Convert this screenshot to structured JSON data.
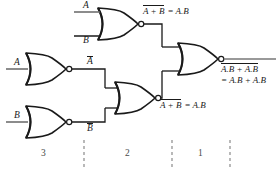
{
  "diagram": {
    "stroke_color": "#1a1a1a",
    "wire_color": "#555555",
    "background": "#ffffff"
  },
  "inputs": {
    "top_gate_a": "A",
    "top_gate_b": "B",
    "inv_a_in": "A",
    "inv_b_in": "B"
  },
  "internal_signals": {
    "a_bar": "A",
    "b_bar": "B"
  },
  "labels": {
    "top_expr_lhs_over": "A + B",
    "top_expr_rhs": "= A.B",
    "mid_expr_lhs_over": "A + B",
    "mid_expr_rhs": "= A.B",
    "out_line1_over": "A.B + A.B",
    "out_line2": "= A.B + A.B"
  },
  "stages": [
    {
      "number": "3"
    },
    {
      "number": "2"
    },
    {
      "number": "1"
    }
  ],
  "gates": [
    {
      "name": "nor-gate-top",
      "type": "NOR",
      "inputs": [
        "A",
        "B"
      ],
      "output": "A+B bar"
    },
    {
      "name": "nor-inverter-a",
      "type": "NOR",
      "inputs": [
        "A"
      ],
      "output": "A bar"
    },
    {
      "name": "nor-inverter-b",
      "type": "NOR",
      "inputs": [
        "B"
      ],
      "output": "B bar"
    },
    {
      "name": "nor-gate-middle",
      "type": "NOR",
      "inputs": [
        "A bar",
        "B bar"
      ],
      "output": "A.B"
    },
    {
      "name": "nor-gate-output",
      "type": "NOR",
      "inputs": [
        "A.B bar",
        "A.B"
      ],
      "output": "XOR"
    }
  ]
}
